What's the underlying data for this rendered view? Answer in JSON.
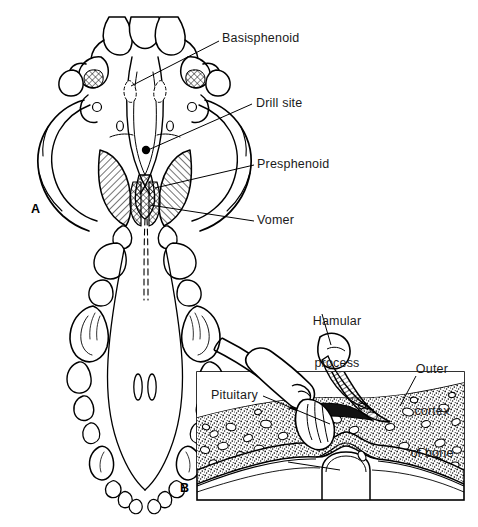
{
  "figure": {
    "background_color": "#ffffff",
    "ink_color": "#000000",
    "text_color": "#1a1a1a",
    "width": 478,
    "height": 527
  },
  "panels": [
    {
      "letter": "A",
      "name": "panel-a-skull-ventral-view",
      "description": "Ventral (palatal) view of a canine skull showing the basisphenoid, presphenoid, vomer and the drill site"
    },
    {
      "letter": "B",
      "name": "panel-b-sagittal-section",
      "description": "Sagittal section through the sphenoid bone showing the drill burr entering the outer cortex above the pituitary"
    }
  ],
  "labels": {
    "basisphenoid": {
      "text": "Basisphenoid",
      "lines": [
        "Basisphenoid"
      ],
      "panel": "A"
    },
    "drill_site": {
      "text": "Drill site",
      "lines": [
        "Drill site"
      ],
      "panel": "A"
    },
    "presphenoid": {
      "text": "Presphenoid",
      "lines": [
        "Presphenoid"
      ],
      "panel": "A"
    },
    "vomer": {
      "text": "Vomer",
      "lines": [
        "Vomer"
      ],
      "panel": "A"
    },
    "hamular_process": {
      "text": "Hamular process",
      "lines": [
        "Hamular",
        "process"
      ],
      "panel": "B"
    },
    "outer_cortex_of_bone": {
      "text": "Outer cortex of bone",
      "lines": [
        "Outer",
        "cortex",
        "of bone"
      ],
      "panel": "B"
    },
    "pituitary": {
      "text": "Pituitary",
      "lines": [
        "Pituitary"
      ],
      "panel": "B"
    }
  },
  "label_lines": {
    "hamular_line1": "Hamular",
    "hamular_line2": "process",
    "cortex_line1": "Outer",
    "cortex_line2": "cortex",
    "cortex_line3": "of bone"
  },
  "markers": {
    "drill_site_dot": {
      "name": "drill-site-marker",
      "shape": "filled-circle",
      "x": 146,
      "y": 150
    }
  }
}
